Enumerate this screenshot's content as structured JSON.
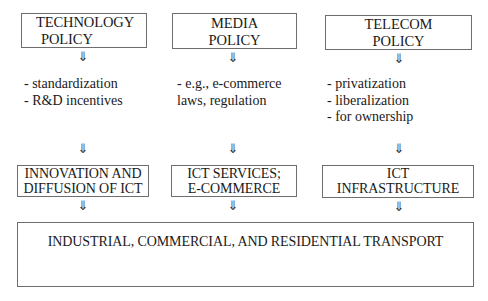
{
  "diagram": {
    "policies": [
      {
        "id": "technology",
        "title_lines": [
          "TECHNOLOGY",
          "POLICY"
        ],
        "measures": [
          "- standardization",
          "- R&D incentives"
        ]
      },
      {
        "id": "media",
        "title_lines": [
          "MEDIA",
          "POLICY"
        ],
        "measures": [
          "- e.g., e-commerce",
          "laws, regulation"
        ]
      },
      {
        "id": "telecom",
        "title_lines": [
          "TELECOM",
          "POLICY"
        ],
        "measures": [
          "- privatization",
          "- liberalization",
          "- for ownership"
        ]
      }
    ],
    "outcomes": [
      {
        "id": "innovation",
        "title_lines": [
          "INNOVATION AND",
          "DIFFUSION OF ICT"
        ]
      },
      {
        "id": "services",
        "title_lines": [
          "ICT SERVICES;",
          "E-COMMERCE"
        ]
      },
      {
        "id": "infrastructure",
        "title_lines": [
          "ICT",
          "INFRASTRUCTURE"
        ]
      }
    ],
    "final": {
      "title": "INDUSTRIAL, COMMERCIAL, AND RESIDENTIAL TRANSPORT"
    },
    "arrow_glyph": "⇓",
    "colors": {
      "border": "#6e6e6e",
      "text": "#1a1a1a",
      "background": "#ffffff"
    }
  }
}
